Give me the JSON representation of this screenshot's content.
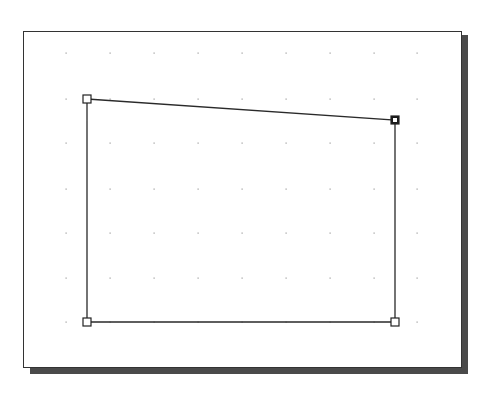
{
  "canvas": {
    "frame": {
      "x": 23,
      "y": 31,
      "width": 437,
      "height": 335
    },
    "shadow_color": "#4a4a4a",
    "border_color": "#333333",
    "background": "#ffffff"
  },
  "grid": {
    "columns": [
      66,
      110,
      154,
      198,
      242,
      286,
      330,
      374,
      417
    ],
    "rows": [
      53,
      99,
      143,
      189,
      233,
      278,
      322
    ],
    "dot_color": "#9a9a9a"
  },
  "shape": {
    "type": "polygon",
    "stroke": "#2a2a2a",
    "points": [
      {
        "x": 87,
        "y": 99
      },
      {
        "x": 395,
        "y": 120
      },
      {
        "x": 395,
        "y": 322
      },
      {
        "x": 87,
        "y": 322
      }
    ]
  },
  "handles": [
    {
      "name": "handle-top-left",
      "x": 87,
      "y": 99,
      "selected": false
    },
    {
      "name": "handle-top-right",
      "x": 395,
      "y": 120,
      "selected": true
    },
    {
      "name": "handle-bottom-right",
      "x": 395,
      "y": 322,
      "selected": false
    },
    {
      "name": "handle-bottom-left",
      "x": 87,
      "y": 322,
      "selected": false
    }
  ]
}
